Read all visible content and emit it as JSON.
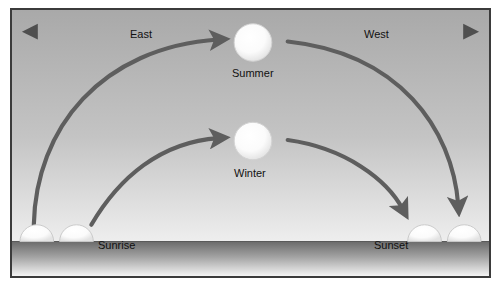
{
  "diagram": {
    "labels": {
      "east": "East",
      "west": "West",
      "summer": "Summer",
      "winter": "Winter",
      "sunrise": "Sunrise",
      "sunset": "Sunset"
    },
    "colors": {
      "border": "#3b3b3b",
      "arrow": "#5e5e5e",
      "sun_fill": "#ffffff",
      "sun_outline": "#c9c9c9",
      "sky_top": "#adadad",
      "sky_bottom": "#e9e9e9",
      "ground_top": "#6f6f6f",
      "ground_bottom": "#f2f2f2",
      "text": "#111111",
      "page_background": "#ffffff"
    },
    "compass_arrows": [
      {
        "name": "east-arrow",
        "direction": "left",
        "label": "East"
      },
      {
        "name": "west-arrow",
        "direction": "right",
        "label": "West"
      }
    ],
    "suns": [
      {
        "name": "summer-sun",
        "label": "Summer",
        "position": "high"
      },
      {
        "name": "winter-sun",
        "label": "Winter",
        "position": "low"
      }
    ],
    "horizon_suns": [
      {
        "name": "sunrise-sun-outer",
        "side": "east"
      },
      {
        "name": "sunrise-sun-inner",
        "side": "east"
      },
      {
        "name": "sunset-sun-inner",
        "side": "west"
      },
      {
        "name": "sunset-sun-outer",
        "side": "west"
      }
    ],
    "paths": [
      {
        "name": "summer-rising-arc",
        "from": "sunrise",
        "to": "summer-sun"
      },
      {
        "name": "summer-setting-arc",
        "from": "summer-sun",
        "to": "sunset"
      },
      {
        "name": "winter-rising-arc",
        "from": "sunrise",
        "to": "winter-sun"
      },
      {
        "name": "winter-setting-arc",
        "from": "winter-sun",
        "to": "sunset"
      }
    ]
  }
}
